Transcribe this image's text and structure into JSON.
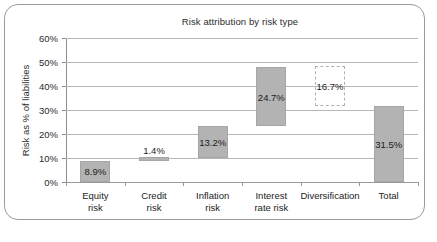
{
  "chart_data": {
    "type": "bar",
    "title": "Risk attribution by risk type",
    "xlabel": "",
    "ylabel": "Risk as % of liabilities",
    "ylim": [
      0,
      60
    ],
    "ytick_labels": [
      "60%",
      "50%",
      "40%",
      "30%",
      "20%",
      "10%",
      "0%"
    ],
    "ytick_values": [
      60,
      50,
      40,
      30,
      20,
      10,
      0
    ],
    "grid": true,
    "legend": "none",
    "categories": [
      "Equity risk",
      "Credit risk",
      "Inflation risk",
      "Interest rate risk",
      "Diversification",
      "Total"
    ],
    "values": [
      8.9,
      1.4,
      13.2,
      24.7,
      16.7,
      31.5
    ],
    "data_labels": [
      "8.9%",
      "1.4%",
      "13.2%",
      "24.7%",
      "16.7%",
      "31.5%"
    ],
    "bars": [
      {
        "category": "Equity risk",
        "label": "8.9%",
        "value": 8.9,
        "base": 0.0,
        "top": 8.9,
        "style": "filled"
      },
      {
        "category": "Credit risk",
        "label": "1.4%",
        "value": 1.4,
        "base": 8.9,
        "top": 10.3,
        "style": "filled"
      },
      {
        "category": "Inflation risk",
        "label": "13.2%",
        "value": 13.2,
        "base": 10.0,
        "top": 23.2,
        "style": "filled"
      },
      {
        "category": "Interest rate risk",
        "label": "24.7%",
        "value": 24.7,
        "base": 23.2,
        "top": 47.9,
        "style": "filled"
      },
      {
        "category": "Diversification",
        "label": "16.7%",
        "value": 16.7,
        "base": 31.5,
        "top": 48.2,
        "style": "dashed-outline"
      },
      {
        "category": "Total",
        "label": "31.5%",
        "value": 31.5,
        "base": 0.0,
        "top": 31.5,
        "style": "filled"
      }
    ]
  },
  "axis": {
    "x_labels": [
      {
        "line1": "Equity",
        "line2": "risk"
      },
      {
        "line1": "Credit",
        "line2": "risk"
      },
      {
        "line1": "Inflation",
        "line2": "risk"
      },
      {
        "line1": "Interest",
        "line2": "rate risk"
      },
      {
        "line1": "Diversification",
        "line2": ""
      },
      {
        "line1": "Total",
        "line2": ""
      }
    ]
  },
  "colors": {
    "bar_fill": "#b3b3b3",
    "bar_stroke": "#a6a6a6",
    "gridline": "#b7b7b7",
    "axis": "#8e8e8e",
    "frame": "#9a9a9a",
    "text": "#1c1c1c",
    "background": "#ffffff"
  }
}
